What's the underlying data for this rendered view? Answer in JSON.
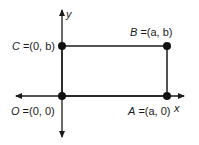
{
  "diagram": {
    "type": "coordinate-rectangle",
    "axes": {
      "x_label": "x",
      "y_label": "y"
    },
    "points": [
      {
        "id": "O",
        "name": "O",
        "coords": "(0, 0)"
      },
      {
        "id": "A",
        "name": "A",
        "coords": "(a, 0)"
      },
      {
        "id": "B",
        "name": "B",
        "coords": "(a, b)"
      },
      {
        "id": "C",
        "name": "C",
        "coords": "(0, b)"
      }
    ],
    "colors": {
      "stroke": "#1a1a1a",
      "point": "#111111"
    }
  }
}
